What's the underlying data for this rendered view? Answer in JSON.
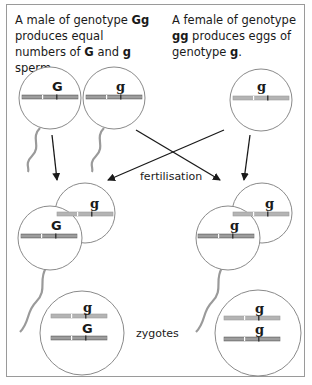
{
  "captions": {
    "male": {
      "pre": "A male of genotype ",
      "genotype": "Gg",
      "mid": " produces equal numbers of ",
      "allele1": "G",
      "and": " and ",
      "allele2": "g",
      "post": " sperm."
    },
    "female": {
      "pre": "A female of genotype ",
      "genotype": "gg",
      "mid": " produces eggs of genotype ",
      "allele": "g",
      "post": "."
    }
  },
  "labels": {
    "fertilisation": "fertilisation",
    "zygotes": "zygotes"
  },
  "gametes": {
    "sperm_G": {
      "allele": "G"
    },
    "sperm_g": {
      "allele": "g"
    },
    "egg": {
      "allele": "g"
    }
  },
  "fertilised": {
    "left": {
      "egg_allele": "g",
      "sperm_allele": "G"
    },
    "right": {
      "egg_allele": "g",
      "sperm_allele": "g"
    }
  },
  "zygotes": {
    "left": {
      "top_allele": "g",
      "bottom_allele": "G"
    },
    "right": {
      "top_allele": "g",
      "bottom_allele": "g"
    }
  },
  "colors": {
    "outline": "#8a8a8a",
    "paternal_chromosome": "#8c8c8c",
    "maternal_chromosome": "#b4b4b4",
    "arrow": "#1a1a1a",
    "tail": "#9a9a9a"
  }
}
